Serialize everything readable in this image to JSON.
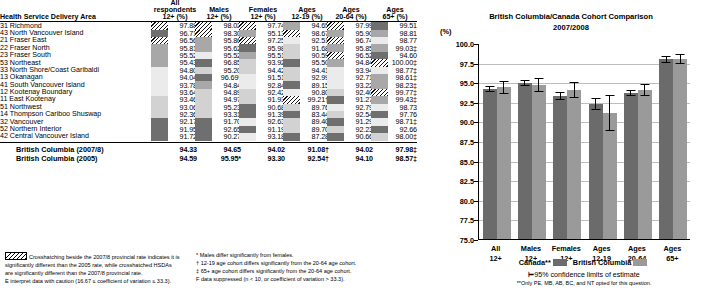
{
  "table": {
    "row_header_label": "Health Service Delivery Area",
    "columns": [
      {
        "l1": "All respondents",
        "l2": "12+ (%)"
      },
      {
        "l1": "Males",
        "l2": "12+ (%)"
      },
      {
        "l1": "Females",
        "l2": "12+ (%)"
      },
      {
        "l1": "Ages",
        "l2": "12-19 (%)"
      },
      {
        "l1": "Ages",
        "l2": "20-64 (%)"
      },
      {
        "l1": "Ages",
        "l2": "65+ (%)"
      }
    ],
    "rows": [
      {
        "area": "31 Richmond",
        "cells": [
          {
            "v": "97.88",
            "s": "hatch"
          },
          {
            "v": "98.02",
            "s": "hatch"
          },
          {
            "v": "97.74",
            "s": "hatch"
          },
          {
            "v": "94.65",
            "s": "m"
          },
          {
            "v": "97.99",
            "s": "hatch"
          },
          {
            "v": "99.51",
            "s": "md"
          }
        ]
      },
      {
        "area": "43 North Vancouver Island",
        "cells": [
          {
            "v": "96.71",
            "s": "md"
          },
          {
            "v": "98.30",
            "s": "hatch"
          },
          {
            "v": "95.13",
            "s": "m"
          },
          {
            "v": "98.67",
            "s": "hatch"
          },
          {
            "v": "95.90",
            "s": "m"
          },
          {
            "v": "98.81",
            "s": "m"
          }
        ]
      },
      {
        "area": "21 Fraser East",
        "cells": [
          {
            "v": "96.56",
            "s": "hatch"
          },
          {
            "v": "95.86",
            "s": "m"
          },
          {
            "v": "97.25",
            "s": "hatch"
          },
          {
            "v": "92.51",
            "s": "vl"
          },
          {
            "v": "96.74",
            "s": "hatch"
          },
          {
            "v": "98.77",
            "s": "vl"
          }
        ]
      },
      {
        "area": "22 Fraser North",
        "cells": [
          {
            "v": "95.81",
            "s": "m"
          },
          {
            "v": "95.62",
            "s": "m"
          },
          {
            "v": "95.98",
            "s": "md"
          },
          {
            "v": "91.68",
            "s": "l"
          },
          {
            "v": "95.85",
            "s": "m"
          },
          {
            "v": "99.03‡",
            "s": "m"
          }
        ]
      },
      {
        "area": "23 Fraser South",
        "cells": [
          {
            "v": "95.52",
            "s": "m"
          },
          {
            "v": "95.52",
            "s": "vl"
          },
          {
            "v": "95.51",
            "s": "m"
          },
          {
            "v": "90.59",
            "s": "l"
          },
          {
            "v": "96.52",
            "s": "hatch"
          },
          {
            "v": "94.60",
            "s": "md"
          }
        ]
      },
      {
        "area": "53 Northeast",
        "cells": [
          {
            "v": "95.43",
            "s": "m"
          },
          {
            "v": "96.85",
            "s": "md"
          },
          {
            "v": "93.92",
            "s": "l"
          },
          {
            "v": "95.50",
            "s": "md"
          },
          {
            "v": "94.84",
            "s": "m"
          },
          {
            "v": "100.00‡",
            "s": "hatch"
          }
        ]
      },
      {
        "area": "33 North Shore/Coast Garibaldi",
        "cells": [
          {
            "v": "94.80",
            "s": "vl"
          },
          {
            "v": "95.20",
            "s": "l"
          },
          {
            "v": "94.42",
            "s": "l"
          },
          {
            "v": "94.41",
            "s": "l"
          },
          {
            "v": "93.94",
            "s": "vl"
          },
          {
            "v": "98.77‡",
            "s": "vl"
          }
        ]
      },
      {
        "area": "13 Okanagan",
        "cells": [
          {
            "v": "94.04",
            "s": "vl"
          },
          {
            "v": "96.69*",
            "s": "md"
          },
          {
            "v": "91.51",
            "s": "vl"
          },
          {
            "v": "92.99",
            "s": "l"
          },
          {
            "v": "92.71",
            "s": "vl"
          },
          {
            "v": "98.61‡",
            "s": "m"
          }
        ]
      },
      {
        "area": "41 South Vancouver Island",
        "cells": [
          {
            "v": "93.78",
            "s": "vl"
          },
          {
            "v": "94.84",
            "s": "m"
          },
          {
            "v": "92.84",
            "s": "vl"
          },
          {
            "v": "89.15",
            "s": "md"
          },
          {
            "v": "93.22",
            "s": "vl"
          },
          {
            "v": "98.23‡",
            "s": "m"
          }
        ]
      },
      {
        "area": "12 Kootenay Boundary",
        "cells": [
          {
            "v": "93.64",
            "s": "vl"
          },
          {
            "v": "94.89",
            "s": "l"
          },
          {
            "v": "92.42",
            "s": "l"
          },
          {
            "v": "90.80",
            "s": "vl"
          },
          {
            "v": "92.40",
            "s": "l"
          },
          {
            "v": "99.77‡",
            "s": "hatch"
          }
        ]
      },
      {
        "area": "11 East Kootenay",
        "cells": [
          {
            "v": "93.46",
            "s": "l"
          },
          {
            "v": "94.97",
            "s": "l"
          },
          {
            "v": "91.93",
            "s": "l"
          },
          {
            "v": "99.21†",
            "s": "hatch"
          },
          {
            "v": "91.27",
            "s": "md"
          },
          {
            "v": "99.43‡",
            "s": "m"
          }
        ]
      },
      {
        "area": "51 Northwest",
        "cells": [
          {
            "v": "93.06",
            "s": "l"
          },
          {
            "v": "95.23",
            "s": "l"
          },
          {
            "v": "90.68",
            "s": "md"
          },
          {
            "v": "89.76",
            "s": "l"
          },
          {
            "v": "92.79",
            "s": "vl"
          },
          {
            "v": "98.73",
            "s": "vl"
          }
        ]
      },
      {
        "area": "14 Thompson Cariboo Shuswap",
        "cells": [
          {
            "v": "92.36",
            "s": "l"
          },
          {
            "v": "93.31",
            "s": "l"
          },
          {
            "v": "91.39",
            "s": "md"
          },
          {
            "v": "83.44",
            "s": "md"
          },
          {
            "v": "92.54",
            "s": "l"
          },
          {
            "v": "97.76",
            "s": "md"
          }
        ]
      },
      {
        "area": "32 Vancouver",
        "cells": [
          {
            "v": "92.17",
            "s": "md"
          },
          {
            "v": "91.70",
            "s": "md"
          },
          {
            "v": "92.63",
            "s": "vl"
          },
          {
            "v": "89.40",
            "s": "l"
          },
          {
            "v": "91.29",
            "s": "md"
          },
          {
            "v": "98.71‡",
            "s": "vl"
          }
        ]
      },
      {
        "area": "52 Northern Interior",
        "cells": [
          {
            "v": "91.95",
            "s": "md"
          },
          {
            "v": "92.65",
            "s": "md"
          },
          {
            "v": "91.19",
            "s": "md"
          },
          {
            "v": "89.70",
            "s": "l"
          },
          {
            "v": "92.23",
            "s": "l"
          },
          {
            "v": "92.66",
            "s": "md"
          }
        ]
      },
      {
        "area": "42 Central Vancouver Island",
        "cells": [
          {
            "v": "91.72",
            "s": "md"
          },
          {
            "v": "90.27",
            "s": "md"
          },
          {
            "v": "93.18",
            "s": "vl"
          },
          {
            "v": "87.28",
            "s": "md"
          },
          {
            "v": "90.66",
            "s": "md"
          },
          {
            "v": "98.00‡",
            "s": "l"
          }
        ]
      }
    ],
    "summary_rows": [
      {
        "label": "British Columbia (2007/8)",
        "values": [
          "94.33",
          "94.65",
          "94.02",
          "91.08†",
          "94.02",
          "97.98‡"
        ]
      },
      {
        "label": "British Columbia (2005)",
        "values": [
          "94.59",
          "95.95*",
          "93.30",
          "92.54†",
          "94.10",
          "98.57‡"
        ]
      }
    ]
  },
  "footnotes": {
    "left": [
      "Crosshatching beside the 2007/8 provincial rate indicates it is",
      "significantly different than the 2005 rate, while crosshatched HSDAs",
      "are significantly different than the 2007/8 provincial rate.",
      "E interpret data with caution (16.67 ≤ coefficient of variation ≤ 33.3)."
    ],
    "right": [
      "* Males differ significantly from females.",
      "† 12-19 age cohort differs significantly from the 20-64 age cohort.",
      "‡ 65+ age cohort differs significantly from the 20-64 age cohort.",
      "F data suppressed (n < 10, or coefficient of variation > 33.3)."
    ]
  },
  "chart_data": {
    "type": "bar",
    "title": "British Columbia/Canada Cohort Comparison",
    "subtitle": "2007/2008",
    "ylabel": "(%)",
    "xlabel": "",
    "ylim": [
      75.0,
      100.0
    ],
    "yticks": [
      "100.0",
      "97.5",
      "95.0",
      "92.5",
      "90.0",
      "87.5",
      "85.0",
      "82.5",
      "80.0",
      "77.5",
      "75.0"
    ],
    "grid": true,
    "legend_position": "bottom",
    "categories": [
      "All 12+",
      "Males 12+",
      "Females 12+",
      "Ages 12-19",
      "Ages 20-64",
      "Ages 65+"
    ],
    "category_labels": [
      {
        "l1": "All",
        "l2": "12+"
      },
      {
        "l1": "Males",
        "l2": "12+"
      },
      {
        "l1": "Females",
        "l2": "12+"
      },
      {
        "l1": "Ages",
        "l2": "12-19"
      },
      {
        "l1": "Ages",
        "l2": "20-64"
      },
      {
        "l1": "Ages",
        "l2": "65+"
      }
    ],
    "series": [
      {
        "name": "Canada**",
        "color": "#6b6b6b",
        "values": [
          94.1,
          94.9,
          93.2,
          92.2,
          93.6,
          97.9
        ],
        "ci_low": [
          93.7,
          94.5,
          92.7,
          91.5,
          93.2,
          97.5
        ],
        "ci_high": [
          94.5,
          95.3,
          93.7,
          93.0,
          94.0,
          98.3
        ]
      },
      {
        "name": "British Columbia",
        "color": "#9a9a9a",
        "values": [
          94.33,
          94.65,
          94.02,
          91.08,
          94.02,
          97.98
        ],
        "ci_low": [
          93.5,
          93.8,
          93.0,
          88.8,
          93.3,
          97.3
        ],
        "ci_high": [
          95.1,
          95.5,
          95.0,
          93.4,
          94.8,
          98.6
        ]
      }
    ],
    "legend": [
      {
        "label": "Canada**",
        "color": "#6b6b6b"
      },
      {
        "label": "British Columbia",
        "color": "#9a9a9a"
      }
    ],
    "ci_note": "95% confidence limits of estimate",
    "footnote": "**Only PE, MB, AB, BC, and NT opted for this question."
  }
}
